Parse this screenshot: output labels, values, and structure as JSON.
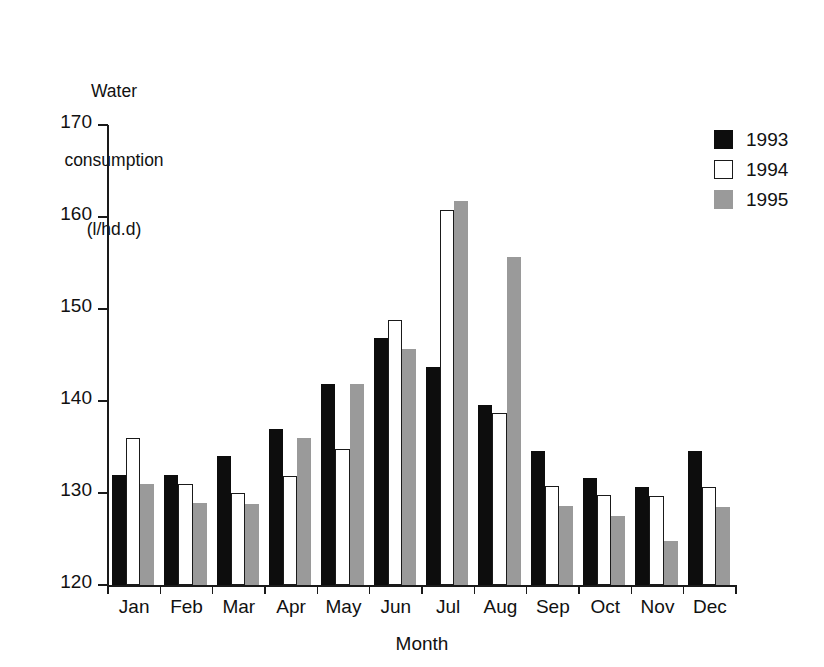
{
  "chart_data": {
    "type": "bar",
    "title": "",
    "ylabel": "Water consumption (l/hd.d)",
    "ylabel_lines": [
      "Water",
      "consumption",
      "(l/hd.d)"
    ],
    "xlabel": "Month",
    "ylim": [
      120,
      170
    ],
    "ytick_labels": [
      "170",
      "160",
      "150",
      "140",
      "130",
      "120"
    ],
    "ytick_values": [
      170,
      160,
      150,
      140,
      130,
      120
    ],
    "grid": false,
    "legend_position": "top-right",
    "categories": [
      "Jan",
      "Feb",
      "Mar",
      "Apr",
      "May",
      "Jun",
      "Jul",
      "Aug",
      "Sep",
      "Oct",
      "Nov",
      "Dec"
    ],
    "series": [
      {
        "name": "1993",
        "color": "#0d0d0d",
        "values": [
          132.0,
          132.0,
          134.0,
          137.0,
          141.8,
          146.8,
          143.7,
          139.6,
          134.6,
          131.6,
          130.6,
          134.6
        ]
      },
      {
        "name": "1994",
        "color": "#ffffff",
        "values": [
          136.0,
          131.0,
          130.0,
          131.8,
          134.8,
          148.8,
          160.8,
          138.7,
          130.8,
          129.8,
          129.7,
          130.7
        ]
      },
      {
        "name": "1995",
        "color": "#9a9a9a",
        "values": [
          131.0,
          128.9,
          128.8,
          136.0,
          141.8,
          145.7,
          161.7,
          155.6,
          128.6,
          127.5,
          124.8,
          128.5
        ]
      }
    ]
  },
  "legend": {
    "entries": [
      {
        "label": "1993",
        "swatch": "legend-swatch-1993"
      },
      {
        "label": "1994",
        "swatch": "legend-swatch-1994"
      },
      {
        "label": "1995",
        "swatch": "legend-swatch-1995"
      }
    ]
  },
  "colors": {
    "series_1993": "#0d0d0d",
    "series_1994": "#ffffff",
    "series_1995": "#9a9a9a",
    "axis": "#1a1a1a",
    "background": "#ffffff"
  }
}
